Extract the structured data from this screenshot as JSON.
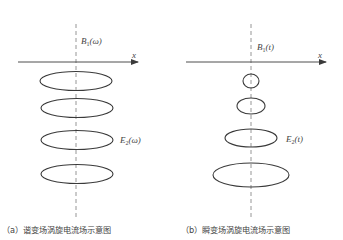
{
  "panels": [
    {
      "id": "a",
      "axis_label": "x",
      "field_label": {
        "main": "B",
        "sub": "1",
        "arg": "(ω)"
      },
      "eddy_label": {
        "main": "E",
        "sub": "2",
        "arg": "(ω)"
      },
      "caption": "（a）谐变场涡旋电流场示意图",
      "loops": [
        {
          "cx": 76,
          "cy": 81,
          "rx": 36,
          "ry": 9.5
        },
        {
          "cx": 77,
          "cy": 108,
          "rx": 36,
          "ry": 9.5
        },
        {
          "cx": 77,
          "cy": 140,
          "rx": 36,
          "ry": 9.5
        },
        {
          "cx": 77,
          "cy": 174,
          "rx": 36,
          "ry": 9.5
        }
      ]
    },
    {
      "id": "b",
      "axis_label": "x",
      "field_label": {
        "main": "B",
        "sub": "1",
        "arg": "(t)"
      },
      "eddy_label": {
        "main": "E",
        "sub": "2",
        "arg": "(t)"
      },
      "caption": "（b）瞬变场涡旋电流场示意图",
      "loops": [
        {
          "cx": 251,
          "cy": 81,
          "rx": 8,
          "ry": 7
        },
        {
          "cx": 251,
          "cy": 106,
          "rx": 14,
          "ry": 8
        },
        {
          "cx": 251,
          "cy": 138,
          "rx": 26,
          "ry": 9
        },
        {
          "cx": 251,
          "cy": 175,
          "rx": 38,
          "ry": 12
        }
      ]
    }
  ],
  "colors": {
    "line": "#3a3a3a",
    "dashed_axis": "#8a8a8a"
  }
}
